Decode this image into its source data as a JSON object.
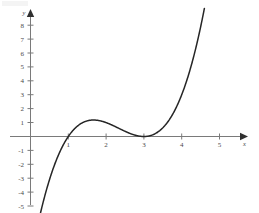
{
  "chart_data": {
    "type": "line",
    "title": "",
    "subtitle": "",
    "xlabel": "x",
    "ylabel": "y",
    "xlim": [
      -0.25,
      5.8
    ],
    "ylim": [
      -5.2,
      8.9
    ],
    "grid": false,
    "legend": null,
    "expression": "f(x) = (x - 1)(x - 3)^2",
    "x_ticks": [
      1,
      2,
      3,
      4,
      5
    ],
    "x_tick_labels": [
      "1",
      "2",
      "3",
      "4",
      "5"
    ],
    "y_ticks": [
      -5,
      -4,
      -3,
      -2,
      -1,
      1,
      2,
      3,
      4,
      5,
      6,
      7,
      8
    ],
    "y_tick_labels": [
      "-5",
      "-4",
      "-3",
      "-2",
      "-1",
      "1",
      "2",
      "3",
      "4",
      "5",
      "6",
      "7",
      "8"
    ],
    "annotations": [],
    "series": [
      {
        "name": "f(x) = (x - 1)(x - 3)^2",
        "color": "#262626",
        "x": [
          0.3,
          0.4,
          0.5,
          0.6,
          0.7,
          0.8,
          0.9,
          1.0,
          1.1,
          1.2,
          1.3,
          1.4,
          1.5,
          1.6,
          1.67,
          1.8,
          1.9,
          2.0,
          2.2,
          2.4,
          2.6,
          2.8,
          3.0,
          3.2,
          3.4,
          3.6,
          3.8,
          4.0,
          4.2,
          4.4,
          4.6,
          4.8,
          5.0,
          5.2,
          5.4,
          5.55
        ],
        "y": [
          -5.29,
          -4.42,
          -3.63,
          -2.9,
          -2.25,
          -1.66,
          -1.13,
          0.0,
          0.36,
          0.65,
          0.87,
          1.02,
          1.13,
          1.18,
          1.19,
          1.15,
          1.1,
          1.0,
          0.77,
          0.51,
          0.29,
          0.11,
          0.0,
          0.04,
          0.19,
          0.47,
          0.9,
          1.5,
          2.29,
          3.29,
          4.54,
          6.05,
          7.84,
          9.95,
          12.39,
          14.47
        ],
        "roots": [
          1.0,
          3.0
        ],
        "local_max": {
          "x": 1.67,
          "y": 0.74
        },
        "local_min": {
          "x": 3.0,
          "y": 0.0
        }
      }
    ]
  },
  "axes": {
    "x_axis_name": "x",
    "y_axis_name": "y",
    "axis_color": "#7a7a7a",
    "curve_color": "#262626",
    "background_color": "#ffffff"
  }
}
